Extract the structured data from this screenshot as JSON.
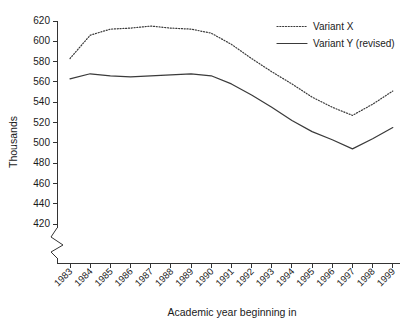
{
  "chart_data": {
    "type": "line",
    "title": "",
    "xlabel": "Academic year beginning in",
    "ylabel": "Thousands",
    "categories": [
      "1983",
      "1984",
      "1985",
      "1986",
      "1987",
      "1988",
      "1989",
      "1990",
      "1991",
      "1992",
      "1993",
      "1994",
      "1995",
      "1996",
      "1997",
      "1998",
      "1999"
    ],
    "series": [
      {
        "name": "Variant X",
        "style": "dotted",
        "values": [
          583,
          606,
          612,
          613,
          615,
          613,
          612,
          608,
          597,
          583,
          570,
          558,
          545,
          535,
          527,
          538,
          551
        ]
      },
      {
        "name": "Variant Y (revised)",
        "style": "solid",
        "values": [
          563,
          568,
          566,
          565,
          566,
          567,
          568,
          566,
          558,
          547,
          535,
          522,
          511,
          503,
          494,
          504,
          515
        ]
      }
    ],
    "ylim": [
      420,
      620
    ],
    "yticks": [
      420,
      440,
      460,
      480,
      500,
      520,
      540,
      560,
      580,
      600,
      620
    ],
    "grid": false,
    "axis_break": true,
    "legend_position": "top-right",
    "legend_entries": [
      "Variant X",
      "Variant Y (revised)"
    ]
  },
  "axes": {
    "y_title": "Thousands",
    "x_title": "Academic year beginning in"
  }
}
